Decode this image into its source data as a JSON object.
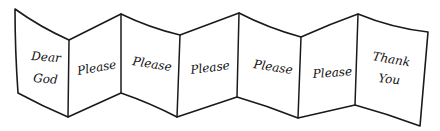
{
  "illustration": {
    "description": "Hand-drawn accordion-folded paper with seven panels",
    "ink_color": "#1a1a1a",
    "paper_color": "#ffffff",
    "panels": [
      {
        "lines": [
          "Dear",
          "God"
        ]
      },
      {
        "lines": [
          "Please"
        ]
      },
      {
        "lines": [
          "Please"
        ]
      },
      {
        "lines": [
          "Please"
        ]
      },
      {
        "lines": [
          "Please"
        ]
      },
      {
        "lines": [
          "Please"
        ]
      },
      {
        "lines": [
          "Thank",
          "You"
        ]
      }
    ]
  }
}
